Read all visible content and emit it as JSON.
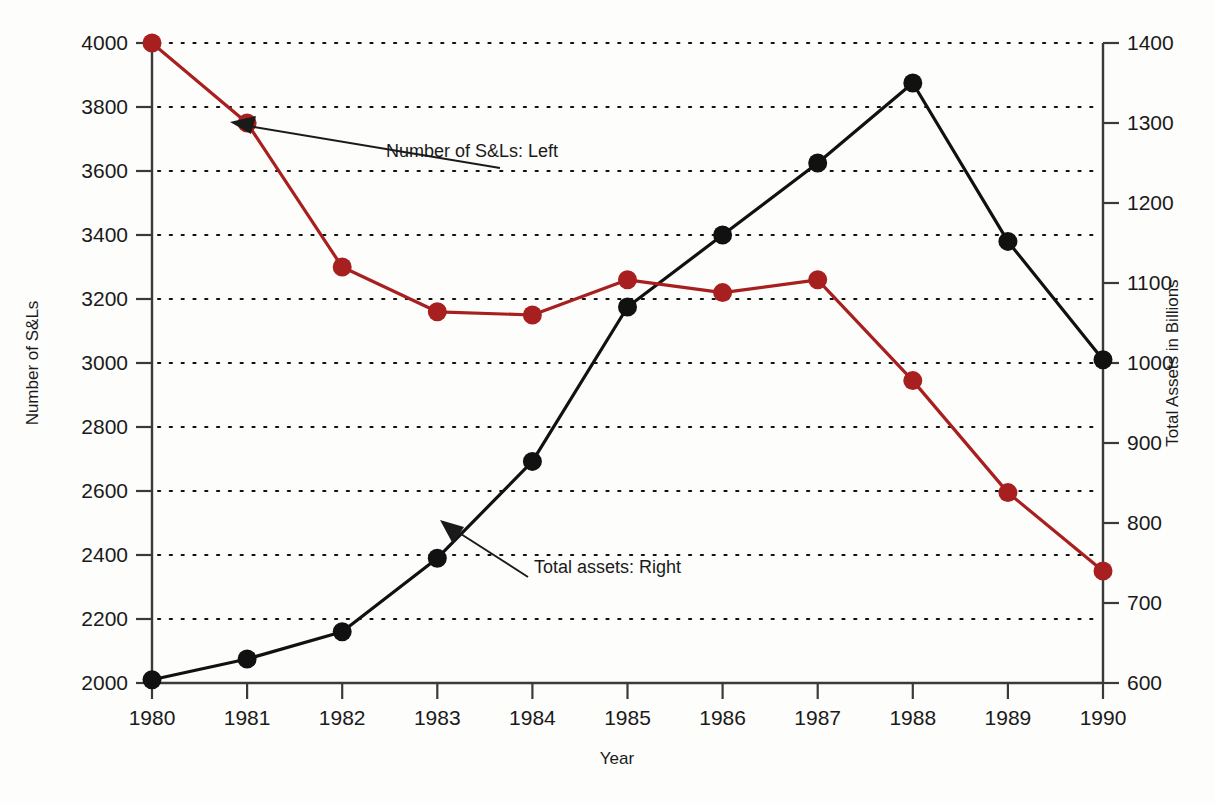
{
  "chart_data": {
    "type": "line",
    "title": "",
    "xlabel": "Year",
    "ylabel": "Number of S&Ls",
    "y2label": "Total Assets in Billions",
    "categories": [
      "1980",
      "1981",
      "1982",
      "1983",
      "1984",
      "1985",
      "1986",
      "1987",
      "1988",
      "1989",
      "1990"
    ],
    "x": [
      1980,
      1981,
      1982,
      1983,
      1984,
      1985,
      1986,
      1987,
      1988,
      1989,
      1990
    ],
    "xlim": [
      1980,
      1990
    ],
    "ylim": [
      2000,
      4000
    ],
    "y2lim": [
      600,
      1400
    ],
    "grid": true,
    "grid_axis": "y-left",
    "legend": "none",
    "series": [
      {
        "name": "Number of S&Ls",
        "axis": "left",
        "color": "#a81f1f",
        "marker": "circle",
        "values": [
          4000,
          3750,
          3300,
          3160,
          3150,
          3260,
          3220,
          3260,
          2945,
          2595,
          2350
        ]
      },
      {
        "name": "Total assets",
        "axis": "right",
        "color": "#111111",
        "marker": "circle",
        "values": [
          604,
          630,
          664,
          756,
          877,
          1070,
          1160,
          1250,
          1350,
          1152,
          1004
        ]
      }
    ],
    "left_ticks": [
      "2000",
      "2200",
      "2400",
      "2600",
      "2800",
      "3000",
      "3200",
      "3400",
      "3600",
      "3800",
      "4000"
    ],
    "left_tick_values": [
      2000,
      2200,
      2400,
      2600,
      2800,
      3000,
      3200,
      3400,
      3600,
      3800,
      4000
    ],
    "right_ticks": [
      "600",
      "700",
      "800",
      "900",
      "1000",
      "1100",
      "1200",
      "1300",
      "1400"
    ],
    "right_tick_values": [
      600,
      700,
      800,
      900,
      1000,
      1100,
      1200,
      1300,
      1400
    ],
    "annotations": [
      {
        "text": "Number of S&Ls:  Left",
        "target_x": 1981,
        "target_value": 3750,
        "axis": "left"
      },
      {
        "text": "Total assets:  Right",
        "target_x": 1983,
        "target_value": 756,
        "axis": "right"
      }
    ]
  },
  "axes": {
    "left_title": "Number of S&Ls",
    "right_title": "Total Assets in Billions",
    "bottom_title": "Year"
  },
  "annotations": {
    "red_series_label": "Number of S&Ls:  Left",
    "black_series_label": "Total assets:  Right"
  },
  "colors": {
    "red_series": "#a81f1f",
    "black_series": "#111111",
    "axis": "#3a3a3a",
    "background": "#fdfdfb"
  }
}
